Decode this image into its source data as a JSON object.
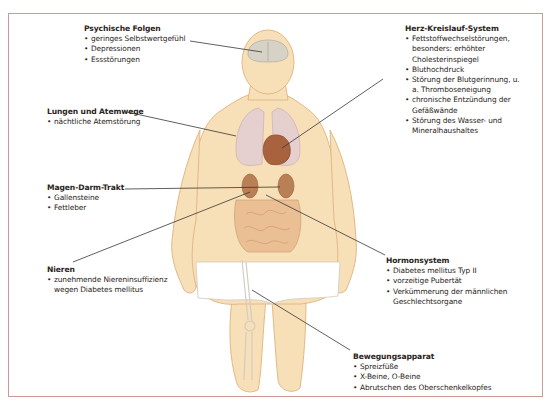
{
  "diagram": {
    "frame_color": "#c99a98",
    "skin_color": "#f7dfb8",
    "skin_outline": "#e3b985",
    "organ_colors": {
      "brain": "#d6d2c6",
      "lungs": "#e6cfcf",
      "heart": "#a8623d",
      "liver_kidneys": "#b97f55",
      "intestines": "#e9bf93",
      "underwear": "#ffffff"
    },
    "callouts": [
      {
        "id": "psychische-folgen",
        "title": "Psychische Folgen",
        "items": [
          "geringes Selbstwertgefühl",
          "Depressionen",
          "Essstörungen"
        ]
      },
      {
        "id": "lungen-atemwege",
        "title": "Lungen und Atemwege",
        "items": [
          "nächtliche Atemstörung"
        ]
      },
      {
        "id": "magen-darm-trakt",
        "title": "Magen-Darm-Trakt",
        "items": [
          "Gallensteine",
          "Fettleber"
        ]
      },
      {
        "id": "nieren",
        "title": "Nieren",
        "items": [
          "zunehmende Niereninsuffizienz wegen Diabetes mellitus"
        ]
      },
      {
        "id": "herz-kreislauf-system",
        "title": "Herz-Kreislauf-System",
        "items": [
          "Fettstoffwechselstörungen, besonders: erhöhter Cholesterinspiegel",
          "Bluthochdruck",
          "Störung der Blutgerinnung, u. a. Thromboseneigung",
          "chronische Entzündung der Gefäßwände",
          "Störung des Wasser- und Mineralhaushaltes"
        ]
      },
      {
        "id": "hormonsystem",
        "title": "Hormonsystem",
        "items": [
          "Diabetes mellitus Typ II",
          "vorzeitige Pubertät",
          "Verkümmerung der männlichen Geschlechtsorgane"
        ]
      },
      {
        "id": "bewegungsapparat",
        "title": "Bewegungsapparat",
        "items": [
          "Spreizfüße",
          "X-Beine, O-Beine",
          "Abrutschen des Oberschenkelkopfes"
        ]
      }
    ]
  }
}
